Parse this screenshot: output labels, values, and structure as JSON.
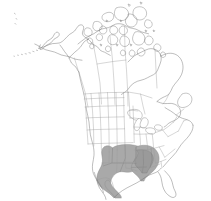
{
  "figure": {
    "title": "North America distribution map",
    "description": "Outline map of North America showing Canada, the United States, Alaska and northern Mexico with state and province boundaries. A solid gray shaded area marks the distribution range across the south-central and southeastern United States.",
    "width": 211,
    "height": 201,
    "background_color": "#ffffff",
    "projection_note": "Conic projection, North America"
  },
  "style": {
    "coastline_color": "#6e6e6e",
    "internal_border_color": "#9a9a9a",
    "range_fill_color": "#a9a9a9",
    "range_fill_color_dark": "#9a9a9a",
    "range_outline_color": "#8c8c8c",
    "lake_fill_color": "#ffffff"
  },
  "legend": {
    "present_label": "Present (shaded)",
    "absent_label": "Absent (unshaded)"
  },
  "regions": {
    "countries": [
      "Canada",
      "United States of America",
      "Mexico"
    ],
    "shaded_states": [
      "Texas",
      "Oklahoma",
      "Kansas",
      "Missouri",
      "Arkansas",
      "Louisiana",
      "Mississippi",
      "Alabama",
      "Tennessee",
      "Georgia"
    ],
    "unshaded_note": "All remaining states, provinces and territories are unshaded"
  },
  "features": {
    "alaska_label": "Alaska",
    "aleutian_label": "Aleutian Islands",
    "arctic_archipelago_label": "Canadian Arctic Archipelago",
    "great_lakes_label": "Great Lakes",
    "hudson_bay_label": "Hudson Bay",
    "newfoundland_label": "Newfoundland",
    "florida_label": "Florida Peninsula",
    "baja_label": "Baja California"
  }
}
